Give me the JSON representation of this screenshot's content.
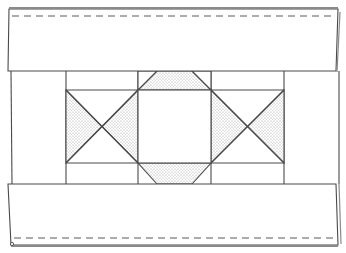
{
  "diagram": {
    "colors": {
      "line": "#4a4a4a",
      "fold_shadow": "#8a8a8a",
      "shade_dot": "#9a9a9a",
      "background": "#ffffff"
    },
    "bands": [
      {
        "id": "top-band",
        "stitch_line": "dashed",
        "position": "top"
      },
      {
        "id": "bottom-band",
        "stitch_line": "dashed",
        "position": "bottom"
      }
    ],
    "blocks": [
      {
        "id": "left-block",
        "type": "hourglass",
        "shaded": [
          "left-triangle",
          "right-triangle"
        ]
      },
      {
        "id": "center-block",
        "type": "square-with-trapezoids",
        "shaded": [
          "top-trapezoid",
          "bottom-trapezoid",
          "left-corners",
          "right-corners"
        ]
      },
      {
        "id": "right-block",
        "type": "hourglass",
        "shaded": [
          "left-triangle",
          "right-triangle"
        ]
      }
    ]
  }
}
